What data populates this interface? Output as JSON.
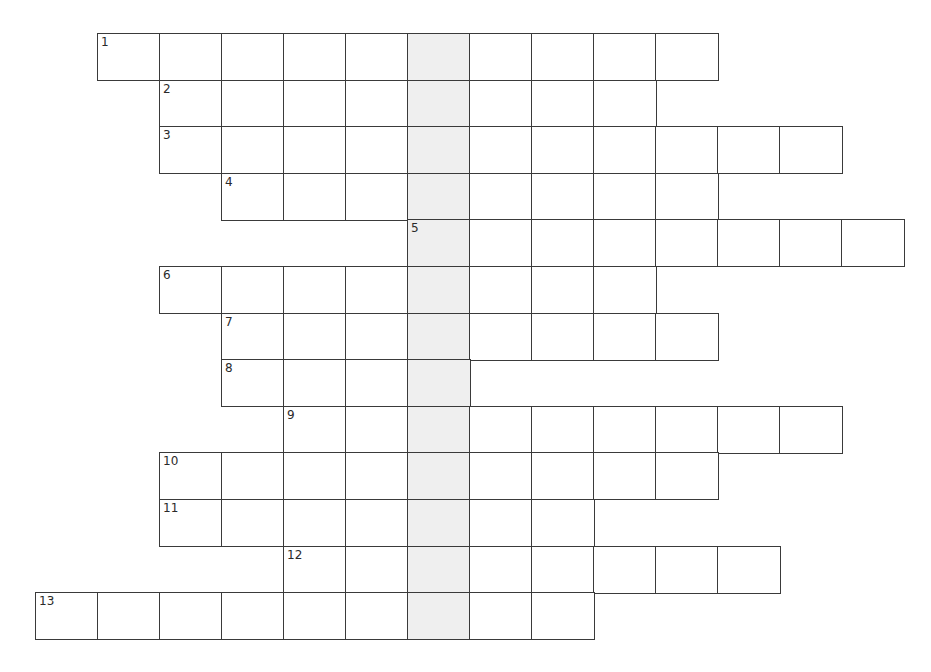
{
  "puzzle": {
    "type": "crossword-acrostic",
    "highlight_column": 6,
    "colors": {
      "border": "#3a3a3a",
      "cell_fill": "#ffffff",
      "highlight_fill": "#efefef",
      "number_text": "#2a2a2a"
    },
    "geometry": {
      "origin_x": 35,
      "origin_y": 33,
      "cell_width": 62,
      "cell_height": 46.6
    },
    "rows": [
      {
        "number": "1",
        "start_col": 1,
        "length": 10
      },
      {
        "number": "2",
        "start_col": 2,
        "length": 8
      },
      {
        "number": "3",
        "start_col": 2,
        "length": 11
      },
      {
        "number": "4",
        "start_col": 3,
        "length": 8
      },
      {
        "number": "5",
        "start_col": 6,
        "length": 8
      },
      {
        "number": "6",
        "start_col": 2,
        "length": 8
      },
      {
        "number": "7",
        "start_col": 3,
        "length": 8
      },
      {
        "number": "8",
        "start_col": 3,
        "length": 4
      },
      {
        "number": "9",
        "start_col": 4,
        "length": 9
      },
      {
        "number": "10",
        "start_col": 2,
        "length": 9
      },
      {
        "number": "11",
        "start_col": 2,
        "length": 7
      },
      {
        "number": "12",
        "start_col": 4,
        "length": 8
      },
      {
        "number": "13",
        "start_col": 0,
        "length": 9
      }
    ]
  }
}
